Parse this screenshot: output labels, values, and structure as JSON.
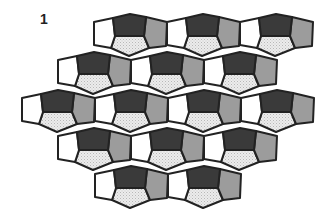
{
  "figure": {
    "label": "1"
  },
  "colors": {
    "outline": "#222222",
    "dark": "#3a3a3a",
    "gray": "#9c9c9c",
    "light": "#e6e6e6",
    "white": "#ffffff"
  },
  "unit_shape": {
    "white": [
      [
        0,
        8
      ],
      [
        19,
        4
      ],
      [
        21,
        22
      ],
      [
        17,
        34
      ],
      [
        0,
        31
      ]
    ],
    "dark": [
      [
        19,
        4
      ],
      [
        36,
        0
      ],
      [
        52,
        3
      ],
      [
        50,
        22
      ],
      [
        21,
        22
      ]
    ],
    "gray": [
      [
        52,
        3
      ],
      [
        73,
        8
      ],
      [
        72,
        32
      ],
      [
        55,
        34
      ],
      [
        50,
        22
      ]
    ],
    "light": [
      [
        21,
        22
      ],
      [
        50,
        22
      ],
      [
        55,
        34
      ],
      [
        35,
        42
      ],
      [
        17,
        34
      ]
    ]
  },
  "unit_scale": 1.0,
  "rows": [
    {
      "peak_y": 14,
      "x0": [
        94,
        167,
        240
      ]
    },
    {
      "peak_y": 52,
      "x0": [
        58,
        131,
        204
      ]
    },
    {
      "peak_y": 90,
      "x0": [
        22,
        95,
        168,
        241
      ]
    },
    {
      "peak_y": 128,
      "x0": [
        58,
        131,
        204
      ]
    },
    {
      "peak_y": 166,
      "x0": [
        95,
        168
      ]
    }
  ]
}
